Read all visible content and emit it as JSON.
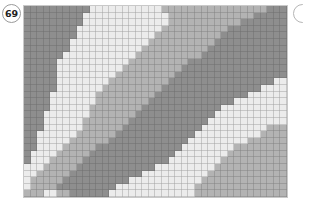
{
  "pattern": {
    "number": "69",
    "grid": {
      "columns": 40,
      "rows": 29
    },
    "colors": {
      "D": "#8e8e8e",
      "M": "#b3b3b3",
      "L": "#ececec"
    },
    "rows": [
      [
        [
          "D",
          0
        ],
        [
          "L",
          10
        ],
        [
          "M",
          21
        ],
        [
          "D",
          37
        ]
      ],
      [
        [
          "D",
          0
        ],
        [
          "L",
          9
        ],
        [
          "M",
          22
        ],
        [
          "D",
          35
        ]
      ],
      [
        [
          "D",
          0
        ],
        [
          "L",
          9
        ],
        [
          "M",
          22
        ],
        [
          "D",
          33
        ]
      ],
      [
        [
          "D",
          0
        ],
        [
          "L",
          8
        ],
        [
          "M",
          21
        ],
        [
          "D",
          31
        ]
      ],
      [
        [
          "D",
          0
        ],
        [
          "L",
          8
        ],
        [
          "M",
          20
        ],
        [
          "D",
          30
        ]
      ],
      [
        [
          "D",
          0
        ],
        [
          "L",
          7
        ],
        [
          "M",
          19
        ],
        [
          "D",
          29
        ]
      ],
      [
        [
          "D",
          0
        ],
        [
          "L",
          7
        ],
        [
          "M",
          18
        ],
        [
          "D",
          28
        ]
      ],
      [
        [
          "D",
          0
        ],
        [
          "L",
          6
        ],
        [
          "M",
          17
        ],
        [
          "D",
          27
        ]
      ],
      [
        [
          "D",
          0
        ],
        [
          "L",
          5
        ],
        [
          "M",
          16
        ],
        [
          "D",
          25
        ]
      ],
      [
        [
          "D",
          0
        ],
        [
          "L",
          5
        ],
        [
          "M",
          15
        ],
        [
          "D",
          24
        ]
      ],
      [
        [
          "D",
          0
        ],
        [
          "L",
          5
        ],
        [
          "M",
          14
        ],
        [
          "D",
          23
        ]
      ],
      [
        [
          "D",
          0
        ],
        [
          "L",
          5
        ],
        [
          "M",
          13
        ],
        [
          "D",
          22
        ],
        [
          "L",
          38
        ]
      ],
      [
        [
          "D",
          0
        ],
        [
          "L",
          5
        ],
        [
          "M",
          12
        ],
        [
          "D",
          21
        ],
        [
          "L",
          36
        ]
      ],
      [
        [
          "D",
          0
        ],
        [
          "L",
          4
        ],
        [
          "M",
          11
        ],
        [
          "D",
          20
        ],
        [
          "L",
          34
        ]
      ],
      [
        [
          "D",
          0
        ],
        [
          "L",
          4
        ],
        [
          "M",
          11
        ],
        [
          "D",
          19
        ],
        [
          "L",
          32
        ]
      ],
      [
        [
          "D",
          0
        ],
        [
          "L",
          4
        ],
        [
          "M",
          10
        ],
        [
          "D",
          18
        ],
        [
          "L",
          30
        ]
      ],
      [
        [
          "D",
          0
        ],
        [
          "L",
          3
        ],
        [
          "M",
          10
        ],
        [
          "D",
          17
        ],
        [
          "L",
          29
        ]
      ],
      [
        [
          "D",
          0
        ],
        [
          "L",
          3
        ],
        [
          "M",
          9
        ],
        [
          "D",
          16
        ],
        [
          "L",
          28
        ]
      ],
      [
        [
          "D",
          0
        ],
        [
          "L",
          3
        ],
        [
          "M",
          9
        ],
        [
          "D",
          15
        ],
        [
          "L",
          27
        ],
        [
          "M",
          37
        ]
      ],
      [
        [
          "D",
          0
        ],
        [
          "L",
          2
        ],
        [
          "M",
          8
        ],
        [
          "D",
          14
        ],
        [
          "L",
          26
        ],
        [
          "M",
          36
        ]
      ],
      [
        [
          "D",
          0
        ],
        [
          "L",
          2
        ],
        [
          "M",
          7
        ],
        [
          "D",
          13
        ],
        [
          "L",
          25
        ],
        [
          "M",
          34
        ]
      ],
      [
        [
          "D",
          0
        ],
        [
          "L",
          2
        ],
        [
          "M",
          6
        ],
        [
          "D",
          11
        ],
        [
          "L",
          24
        ],
        [
          "M",
          32
        ]
      ],
      [
        [
          "D",
          0
        ],
        [
          "L",
          1
        ],
        [
          "M",
          5
        ],
        [
          "D",
          10
        ],
        [
          "L",
          23
        ],
        [
          "M",
          31
        ]
      ],
      [
        [
          "D",
          0
        ],
        [
          "L",
          1
        ],
        [
          "M",
          4
        ],
        [
          "D",
          9
        ],
        [
          "L",
          22
        ],
        [
          "M",
          30
        ]
      ],
      [
        [
          "L",
          0
        ],
        [
          "M",
          3
        ],
        [
          "D",
          8
        ],
        [
          "L",
          20
        ],
        [
          "M",
          29
        ]
      ],
      [
        [
          "L",
          0
        ],
        [
          "M",
          2
        ],
        [
          "D",
          7
        ],
        [
          "L",
          18
        ],
        [
          "M",
          28
        ]
      ],
      [
        [
          "L",
          0
        ],
        [
          "M",
          1
        ],
        [
          "D",
          6
        ],
        [
          "L",
          16
        ],
        [
          "M",
          27
        ]
      ],
      [
        [
          "L",
          0
        ],
        [
          "M",
          1
        ],
        [
          "D",
          5
        ],
        [
          "L",
          14
        ],
        [
          "M",
          26
        ]
      ],
      [
        [
          "M",
          0
        ],
        [
          "L",
          3
        ],
        [
          "M",
          5
        ],
        [
          "D",
          7
        ],
        [
          "L",
          13
        ],
        [
          "M",
          26
        ]
      ]
    ]
  }
}
